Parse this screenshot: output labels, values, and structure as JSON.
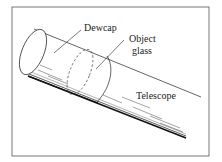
{
  "diagram": {
    "type": "technical-illustration",
    "labels": {
      "dewcap": "Dewcap",
      "object_glass_line1": "Object",
      "object_glass_line2": "glass",
      "telescope": "Telescope"
    },
    "colors": {
      "ink": "#222222",
      "border": "#555555",
      "background": "#ffffff"
    }
  }
}
